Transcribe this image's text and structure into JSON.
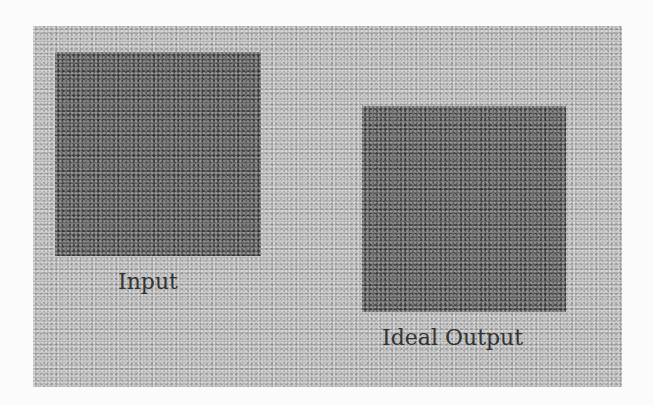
{
  "figure": {
    "panels": [
      {
        "id": "input",
        "label": "Input",
        "description": "dark gravel/rock texture patch"
      },
      {
        "id": "ideal_output",
        "label": "Ideal Output",
        "description": "dark gravel/rock texture patch"
      }
    ],
    "colors": {
      "page_background": "#fbfbfb",
      "outer_texture": "#b3b3b3",
      "inner_texture": "#5e5e5e",
      "label_text": "#333333"
    }
  }
}
